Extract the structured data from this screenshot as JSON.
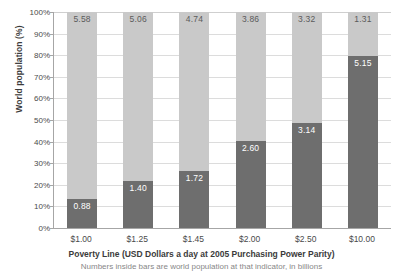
{
  "chart_data": {
    "type": "bar",
    "subtype": "stacked-100-percent",
    "title": "",
    "xlabel": "Poverty Line (USD Dollars a day at 2005 Purchasing Power Parity)",
    "ylabel": "World population (%)",
    "caption": "Numbers inside bars are world population at that indicator, in billions",
    "categories": [
      "$1.00",
      "$1.25",
      "$1.45",
      "$2.00",
      "$2.50",
      "$10.00"
    ],
    "ylim": [
      0,
      100
    ],
    "ytick_labels": [
      "0%",
      "10%",
      "20%",
      "30%",
      "40%",
      "50%",
      "60%",
      "70%",
      "80%",
      "90%",
      "100%"
    ],
    "ytick_values": [
      0,
      10,
      20,
      30,
      40,
      50,
      60,
      70,
      80,
      90,
      100
    ],
    "grid": true,
    "legend": "none",
    "series": [
      {
        "name": "Population below poverty line (billions)",
        "color": "#6e6e6e",
        "values": [
          0.88,
          1.4,
          1.72,
          2.6,
          3.14,
          5.15
        ],
        "labels": [
          "0.88",
          "1.40",
          "1.72",
          "2.60",
          "3.14",
          "5.15"
        ],
        "percent": [
          13.6,
          21.7,
          26.6,
          40.2,
          48.6,
          79.7
        ]
      },
      {
        "name": "Population above poverty line (billions)",
        "color": "#c9c9c9",
        "values": [
          5.58,
          5.06,
          4.74,
          3.86,
          3.32,
          1.31
        ],
        "labels": [
          "5.58",
          "5.06",
          "4.74",
          "3.86",
          "3.32",
          "1.31"
        ],
        "percent": [
          86.4,
          78.3,
          73.4,
          59.8,
          51.4,
          20.3
        ]
      }
    ]
  },
  "colors": {
    "upper_segment": "#c9c9c9",
    "lower_segment": "#6e6e6e",
    "gridline": "#dcdcdc",
    "axis": "#a6a6a6",
    "text": "#3b3b3b"
  }
}
